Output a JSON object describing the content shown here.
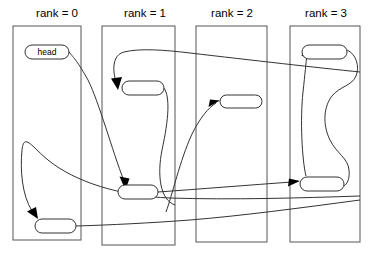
{
  "figure": {
    "title": "",
    "type": "rank-partitioned linked list diagram",
    "background_color": "#ffffff",
    "line_color": "#333333",
    "box_stroke_color": "#555555"
  },
  "ranks": [
    {
      "id": "rank0",
      "label": "rank = 0",
      "label_x": 57,
      "label_y": 16,
      "box": {
        "x": 13,
        "y": 26,
        "w": 68,
        "h": 214
      }
    },
    {
      "id": "rank1",
      "label": "rank = 1",
      "label_x": 145,
      "label_y": 16,
      "box": {
        "x": 102,
        "y": 26,
        "w": 73,
        "h": 219
      }
    },
    {
      "id": "rank2",
      "label": "rank = 2",
      "label_x": 232,
      "label_y": 16,
      "box": {
        "x": 196,
        "y": 26,
        "w": 71,
        "h": 216
      }
    },
    {
      "id": "rank3",
      "label": "rank = 3",
      "label_x": 326,
      "label_y": 16,
      "box": {
        "x": 290,
        "y": 26,
        "w": 70,
        "h": 216
      }
    }
  ],
  "nodes": [
    {
      "id": "head",
      "label": "head",
      "rank": 0,
      "x": 25,
      "y": 45,
      "w": 44,
      "h": 14
    },
    {
      "id": "n0_bottom",
      "label": "",
      "rank": 0,
      "x": 35,
      "y": 219,
      "w": 41,
      "h": 14
    },
    {
      "id": "n1_top",
      "label": "",
      "rank": 1,
      "x": 122,
      "y": 81,
      "w": 42,
      "h": 14
    },
    {
      "id": "n1_bottom",
      "label": "",
      "rank": 1,
      "x": 118,
      "y": 185,
      "w": 40,
      "h": 14
    },
    {
      "id": "n2_mid",
      "label": "",
      "rank": 2,
      "x": 220,
      "y": 95,
      "w": 42,
      "h": 13
    },
    {
      "id": "n3_top",
      "label": "",
      "rank": 3,
      "x": 302,
      "y": 45,
      "w": 45,
      "h": 14
    },
    {
      "id": "n3_bottom",
      "label": "",
      "rank": 3,
      "x": 300,
      "y": 177,
      "w": 44,
      "h": 14
    }
  ],
  "edges": [
    {
      "id": "e_head_to_n1_bottom",
      "from": "head",
      "to": "n1_bottom",
      "arrow": true
    },
    {
      "id": "e_n1top_to_n2mid",
      "from": "n1_top",
      "to": "n2_mid",
      "arrow": true
    },
    {
      "id": "e_n3top_to_n3bottom",
      "from": "n3_top",
      "to": "n3_bottom",
      "arrow": false
    },
    {
      "id": "e_n3bottom_to_n1top",
      "from": "n3_bottom",
      "to": "n1_top",
      "arrow": true
    },
    {
      "id": "e_n1bottom_to_n3bot",
      "from": "n1_bottom",
      "to": "n3_bottom",
      "arrow": true
    },
    {
      "id": "e_right_to_n0bottom",
      "from": "n3_top",
      "to": "n0_bottom",
      "arrow": true
    },
    {
      "id": "e_n0bottom_to_right",
      "from": "n0_bottom",
      "to": "n3_top",
      "arrow": false
    }
  ]
}
